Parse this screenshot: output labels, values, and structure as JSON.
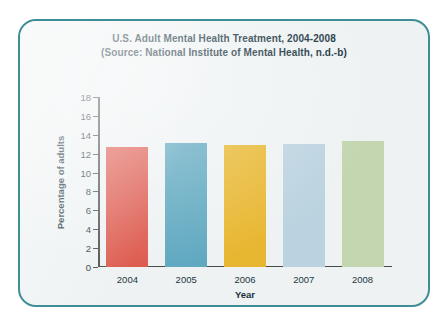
{
  "figure": {
    "frame_border_color": "#3f8e96",
    "frame_background_color": "#eef2f3",
    "page_background_color": "#ffffff"
  },
  "chart_data": {
    "type": "bar",
    "title": "U.S. Adult Mental Health Treatment, 2004-2008",
    "subtitle": "(Source: National Institute of Mental Health, n.d.-b)",
    "title_lines": [
      "U.S. Adult Mental Health Treatment, 2004-2008",
      "(Source: National Institute of Mental Health, n.d.-b)"
    ],
    "xlabel": "Year",
    "ylabel": "Percentage of adults",
    "categories": [
      "2004",
      "2005",
      "2006",
      "2007",
      "2008"
    ],
    "values": [
      12.7,
      13.1,
      12.9,
      13.0,
      13.3
    ],
    "bar_colors": [
      "#dd5a4e",
      "#5fa8c0",
      "#e8b731",
      "#bbd3e0",
      "#c3d6af"
    ],
    "ylim": [
      0,
      18
    ],
    "ytick_step": 2,
    "ytick_labels": [
      "18",
      "16",
      "14",
      "12",
      "10",
      "8",
      "6",
      "4",
      "2",
      "0"
    ],
    "ytick_values": [
      18,
      16,
      14,
      12,
      10,
      8,
      6,
      4,
      2,
      0
    ],
    "grid": false,
    "legend": "none",
    "axis_color": "#4a4a4a",
    "text_color": "#16313c"
  }
}
